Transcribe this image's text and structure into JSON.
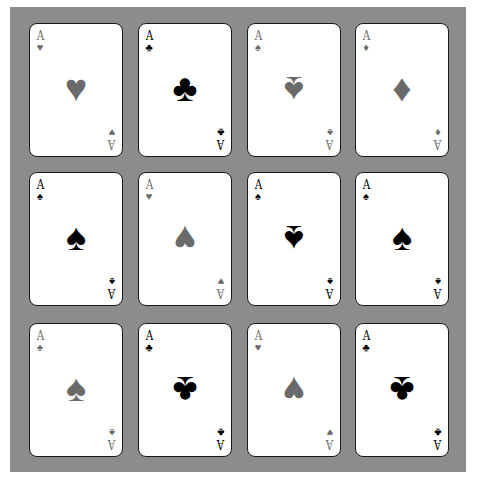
{
  "colors": {
    "panel": "#8c8c8c",
    "card": "#ffffff",
    "gray_suit": "#6a6a6a",
    "black_suit": "#000000"
  },
  "grid": {
    "columns_x": [
      29,
      138,
      247,
      355
    ],
    "rows_y": [
      23,
      172,
      323
    ]
  },
  "cards": [
    {
      "row": 0,
      "col": 0,
      "rank": "A",
      "suit": "heart",
      "glyph": "♥",
      "color": "gray",
      "center_inverted": false
    },
    {
      "row": 0,
      "col": 1,
      "rank": "A",
      "suit": "club",
      "glyph": "♣",
      "color": "black",
      "center_inverted": false
    },
    {
      "row": 0,
      "col": 2,
      "rank": "A",
      "suit": "spade",
      "glyph": "♠",
      "color": "gray",
      "center_inverted": true
    },
    {
      "row": 0,
      "col": 3,
      "rank": "A",
      "suit": "diamond",
      "glyph": "♦",
      "color": "gray",
      "center_inverted": false
    },
    {
      "row": 1,
      "col": 0,
      "rank": "A",
      "suit": "spade",
      "glyph": "♠",
      "color": "black",
      "center_inverted": false
    },
    {
      "row": 1,
      "col": 1,
      "rank": "A",
      "suit": "heart",
      "glyph": "♥",
      "color": "gray",
      "center_inverted": true
    },
    {
      "row": 1,
      "col": 2,
      "rank": "A",
      "suit": "spade",
      "glyph": "♠",
      "color": "black",
      "center_inverted": true
    },
    {
      "row": 1,
      "col": 3,
      "rank": "A",
      "suit": "spade",
      "glyph": "♠",
      "color": "black",
      "center_inverted": false
    },
    {
      "row": 2,
      "col": 0,
      "rank": "A",
      "suit": "spade",
      "glyph": "♠",
      "color": "gray",
      "center_inverted": false
    },
    {
      "row": 2,
      "col": 1,
      "rank": "A",
      "suit": "club",
      "glyph": "♣",
      "color": "black",
      "center_inverted": true
    },
    {
      "row": 2,
      "col": 2,
      "rank": "A",
      "suit": "heart",
      "glyph": "♥",
      "color": "gray",
      "center_inverted": true
    },
    {
      "row": 2,
      "col": 3,
      "rank": "A",
      "suit": "club",
      "glyph": "♣",
      "color": "black",
      "center_inverted": true
    }
  ]
}
